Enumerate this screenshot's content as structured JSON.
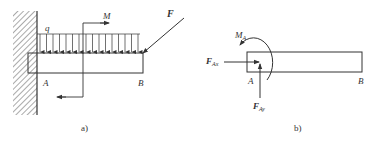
{
  "figure_a": {
    "caption": "a)",
    "labels": {
      "q": "q",
      "M": "M",
      "F": "F",
      "A": "A",
      "B": "B"
    }
  },
  "figure_b": {
    "caption": "b)",
    "labels": {
      "MA_main": "M",
      "MA_sub": "A",
      "FAx_main": "F",
      "FAx_sub": "Ax",
      "FAy_main": "F",
      "FAy_sub": "Ay",
      "A": "A",
      "B": "B"
    }
  },
  "colors": {
    "stroke": "#333333",
    "hatch": "#555555",
    "background": "#ffffff"
  }
}
